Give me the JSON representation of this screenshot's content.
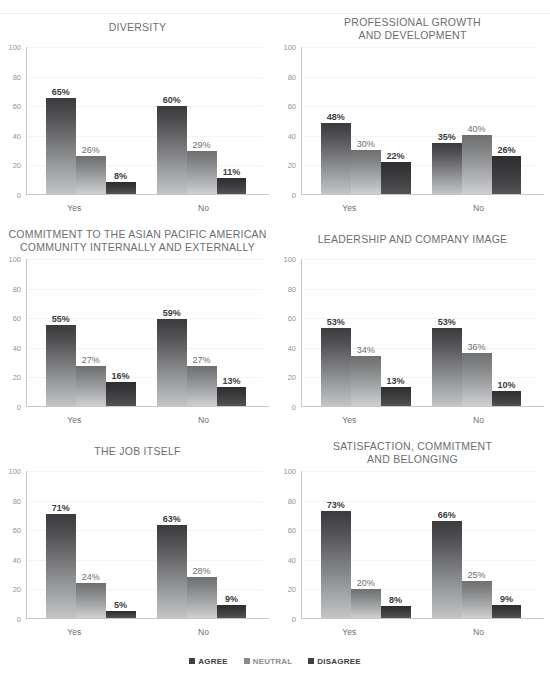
{
  "legend": {
    "items": [
      {
        "label": "AGREE",
        "key": "agree",
        "color": "#3f3f41"
      },
      {
        "label": "NEUTRAL",
        "key": "neutral",
        "color": "#8a8b8d"
      },
      {
        "label": "DISAGREE",
        "key": "disagree",
        "color": "#3f3f41"
      }
    ]
  },
  "axis": {
    "yticks": [
      "0",
      "20",
      "40",
      "60",
      "80",
      "100"
    ],
    "ymin": 0,
    "ymax": 100,
    "groups": [
      "Yes",
      "No"
    ]
  },
  "chart_data": [
    {
      "type": "bar",
      "title": "DIVERSITY",
      "title_lines": [
        "DIVERSITY"
      ],
      "categories": [
        "Yes",
        "No"
      ],
      "series": [
        {
          "name": "AGREE",
          "values": [
            65,
            60
          ],
          "labels": [
            "65%",
            "60%"
          ]
        },
        {
          "name": "NEUTRAL",
          "values": [
            26,
            29
          ],
          "labels": [
            "26%",
            "29%"
          ]
        },
        {
          "name": "DISAGREE",
          "values": [
            8,
            11
          ],
          "labels": [
            "8%",
            "11%"
          ]
        }
      ],
      "xlabel": "",
      "ylabel": "",
      "ylim": [
        0,
        100
      ],
      "grid": true,
      "legend_position": "bottom-shared"
    },
    {
      "type": "bar",
      "title": "PROFESSIONAL GROWTH AND DEVELOPMENT",
      "title_lines": [
        "PROFESSIONAL GROWTH",
        "AND DEVELOPMENT"
      ],
      "categories": [
        "Yes",
        "No"
      ],
      "series": [
        {
          "name": "AGREE",
          "values": [
            48,
            35
          ],
          "labels": [
            "48%",
            "35%"
          ]
        },
        {
          "name": "NEUTRAL",
          "values": [
            30,
            40
          ],
          "labels": [
            "30%",
            "40%"
          ]
        },
        {
          "name": "DISAGREE",
          "values": [
            22,
            26
          ],
          "labels": [
            "22%",
            "26%"
          ]
        }
      ],
      "xlabel": "",
      "ylabel": "",
      "ylim": [
        0,
        100
      ],
      "grid": true,
      "legend_position": "bottom-shared"
    },
    {
      "type": "bar",
      "title": "COMMITMENT TO THE ASIAN PACIFIC AMERICAN COMMUNITY INTERNALLY AND EXTERNALLY",
      "title_lines": [
        "COMMITMENT TO THE ASIAN PACIFIC AMERICAN",
        "COMMUNITY INTERNALLY AND EXTERNALLY"
      ],
      "categories": [
        "Yes",
        "No"
      ],
      "series": [
        {
          "name": "AGREE",
          "values": [
            55,
            59
          ],
          "labels": [
            "55%",
            "59%"
          ]
        },
        {
          "name": "NEUTRAL",
          "values": [
            27,
            27
          ],
          "labels": [
            "27%",
            "27%"
          ]
        },
        {
          "name": "DISAGREE",
          "values": [
            16,
            13
          ],
          "labels": [
            "16%",
            "13%"
          ]
        }
      ],
      "xlabel": "",
      "ylabel": "",
      "ylim": [
        0,
        100
      ],
      "grid": true,
      "legend_position": "bottom-shared"
    },
    {
      "type": "bar",
      "title": "LEADERSHIP AND COMPANY IMAGE",
      "title_lines": [
        "LEADERSHIP AND COMPANY IMAGE"
      ],
      "categories": [
        "Yes",
        "No"
      ],
      "series": [
        {
          "name": "AGREE",
          "values": [
            53,
            53
          ],
          "labels": [
            "53%",
            "53%"
          ]
        },
        {
          "name": "NEUTRAL",
          "values": [
            34,
            36
          ],
          "labels": [
            "34%",
            "36%"
          ]
        },
        {
          "name": "DISAGREE",
          "values": [
            13,
            10
          ],
          "labels": [
            "13%",
            "10%"
          ]
        }
      ],
      "xlabel": "",
      "ylabel": "",
      "ylim": [
        0,
        100
      ],
      "grid": true,
      "legend_position": "bottom-shared"
    },
    {
      "type": "bar",
      "title": "THE JOB ITSELF",
      "title_lines": [
        "THE JOB ITSELF"
      ],
      "categories": [
        "Yes",
        "No"
      ],
      "series": [
        {
          "name": "AGREE",
          "values": [
            71,
            63
          ],
          "labels": [
            "71%",
            "63%"
          ]
        },
        {
          "name": "NEUTRAL",
          "values": [
            24,
            28
          ],
          "labels": [
            "24%",
            "28%"
          ]
        },
        {
          "name": "DISAGREE",
          "values": [
            5,
            9
          ],
          "labels": [
            "5%",
            "9%"
          ]
        }
      ],
      "xlabel": "",
      "ylabel": "",
      "ylim": [
        0,
        100
      ],
      "grid": true,
      "legend_position": "bottom-shared"
    },
    {
      "type": "bar",
      "title": "SATISFACTION, COMMITMENT AND BELONGING",
      "title_lines": [
        "SATISFACTION, COMMITMENT",
        "AND BELONGING"
      ],
      "categories": [
        "Yes",
        "No"
      ],
      "series": [
        {
          "name": "AGREE",
          "values": [
            73,
            66
          ],
          "labels": [
            "73%",
            "66%"
          ]
        },
        {
          "name": "NEUTRAL",
          "values": [
            20,
            25
          ],
          "labels": [
            "20%",
            "25%"
          ]
        },
        {
          "name": "DISAGREE",
          "values": [
            8,
            9
          ],
          "labels": [
            "8%",
            "9%"
          ]
        }
      ],
      "xlabel": "",
      "ylabel": "",
      "ylim": [
        0,
        100
      ],
      "grid": true,
      "legend_position": "bottom-shared"
    }
  ]
}
